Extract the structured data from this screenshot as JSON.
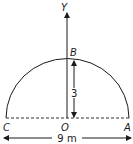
{
  "diagram": {
    "type": "semicircular-arch",
    "axis_label": "Y",
    "points": {
      "top": "B",
      "left": "C",
      "center": "O",
      "right": "A"
    },
    "height_label": "3",
    "span_label": "9 m",
    "colors": {
      "stroke": "#1a1a1a",
      "background": "#ffffff"
    }
  }
}
